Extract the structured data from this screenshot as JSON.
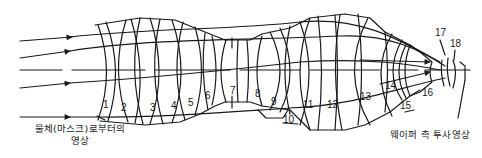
{
  "diagram": {
    "type": "optical-projection-lens-cross-section",
    "colors": {
      "line": "#1a1a1a",
      "background": "#ffffff"
    },
    "lens_labels": [
      {
        "id": "1",
        "x": 103,
        "y": 100
      },
      {
        "id": "2",
        "x": 121,
        "y": 103
      },
      {
        "id": "3",
        "x": 150,
        "y": 103
      },
      {
        "id": "4",
        "x": 171,
        "y": 101
      },
      {
        "id": "5",
        "x": 188,
        "y": 98
      },
      {
        "id": "6",
        "x": 205,
        "y": 91
      },
      {
        "id": "7",
        "x": 230,
        "y": 86
      },
      {
        "id": "8",
        "x": 255,
        "y": 89
      },
      {
        "id": "9",
        "x": 271,
        "y": 97
      },
      {
        "id": "10",
        "x": 283,
        "y": 115
      },
      {
        "id": "11",
        "x": 303,
        "y": 100
      },
      {
        "id": "12",
        "x": 327,
        "y": 100
      },
      {
        "id": "13",
        "x": 360,
        "y": 92
      },
      {
        "id": "14",
        "x": 385,
        "y": 81
      },
      {
        "id": "15",
        "x": 400,
        "y": 101
      },
      {
        "id": "16",
        "x": 422,
        "y": 88
      },
      {
        "id": "17",
        "x": 435,
        "y": 28
      },
      {
        "id": "18",
        "x": 450,
        "y": 39
      }
    ],
    "captions": {
      "object_side_line1": "물체(마스크)로부터의",
      "object_side_line2": "영상",
      "wafer_side": "웨이퍼 측 투사영상"
    }
  }
}
